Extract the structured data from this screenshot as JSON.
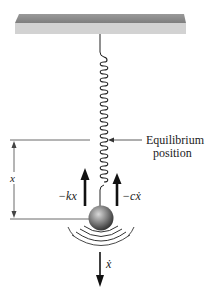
{
  "diagram": {
    "type": "spring-mass-damper",
    "labels": {
      "equilibrium_line1": "Equilibrium",
      "equilibrium_line2": "position",
      "displacement": "x",
      "spring_force": "−kx",
      "damping_force": "−cẋ",
      "velocity": "ẋ"
    },
    "colors": {
      "ceiling_top": "#8a8a8a",
      "ceiling_front": "#cfcfcf",
      "line": "#222222",
      "mass_dark": "#3a3a3a",
      "mass_light": "#bdbdbd"
    }
  }
}
